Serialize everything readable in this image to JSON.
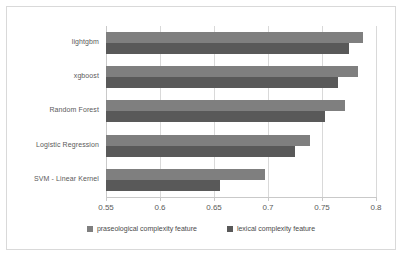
{
  "chart_data": {
    "type": "bar",
    "orientation": "horizontal",
    "title": "",
    "xlabel": "",
    "ylabel": "",
    "xlim": [
      0.55,
      0.8
    ],
    "xticks": [
      "0.55",
      "0.6",
      "0.65",
      "0.7",
      "0.75",
      "0.8"
    ],
    "xtick_values": [
      0.55,
      0.6,
      0.65,
      0.7,
      0.75,
      0.8
    ],
    "grid": true,
    "legend_position": "bottom",
    "categories": [
      "lightgbm",
      "xgboost",
      "Random Forest",
      "Logistic Regression",
      "SVM - Linear Kernel"
    ],
    "series": [
      {
        "name": "praseological complexity feature",
        "color": "#7f7f7f",
        "values": [
          0.788,
          0.783,
          0.771,
          0.739,
          0.697
        ]
      },
      {
        "name": "lexical complexity feature",
        "color": "#595959",
        "values": [
          0.775,
          0.765,
          0.753,
          0.725,
          0.656
        ]
      }
    ]
  },
  "legend": {
    "items": [
      {
        "label": "praseological complexity feature",
        "color": "#7f7f7f"
      },
      {
        "label": "lexical complexity feature",
        "color": "#595959"
      }
    ]
  },
  "colors": {
    "frame_border": "#d9d9d9",
    "gridline": "#d9d9d9",
    "axis": "#c9c9c9",
    "text": "#5a5a5a",
    "background": "#ffffff"
  }
}
